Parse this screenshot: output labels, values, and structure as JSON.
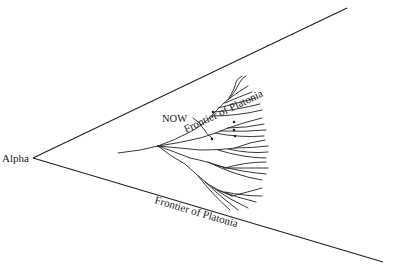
{
  "diagram": {
    "origin_label": "Alpha",
    "upper_frontier_label": "Frontier of Platonia",
    "lower_frontier_label": "Frontier of Platonia",
    "now_label": "NOW",
    "line_color": "#222222",
    "background": "#ffffff"
  }
}
